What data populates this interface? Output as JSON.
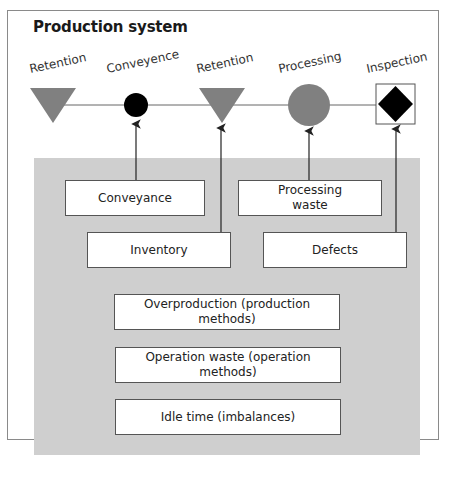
{
  "title": "Production system",
  "stages": [
    {
      "label": "Retention",
      "symbol": "inverted-triangle",
      "color": "#808080"
    },
    {
      "label": "Conveyence",
      "symbol": "small-circle",
      "color": "#000000"
    },
    {
      "label": "Retention",
      "symbol": "inverted-triangle",
      "color": "#808080"
    },
    {
      "label": "Processing",
      "symbol": "large-circle",
      "color": "#808080"
    },
    {
      "label": "Inspection",
      "symbol": "diamond-in-square",
      "color": "#000000"
    }
  ],
  "waste_boxes": {
    "conveyance": "Conveyance",
    "processing_waste_line1": "Processing",
    "processing_waste_line2": "waste",
    "inventory": "Inventory",
    "defects": "Defects",
    "overproduction": "Overproduction (production methods)",
    "operation_waste": "Operation waste (operation methods)",
    "idle_time": "Idle time (imbalances)"
  },
  "colors": {
    "background_region": "#cfcfcf",
    "symbol_gray": "#808080",
    "symbol_black": "#000000",
    "line": "#555555"
  }
}
